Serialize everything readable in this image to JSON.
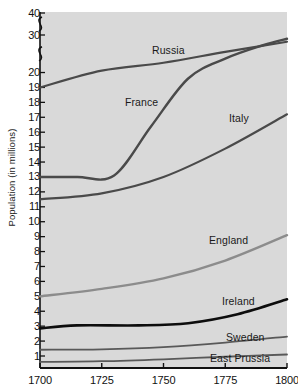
{
  "chart_data": {
    "type": "line",
    "title": "",
    "xlabel": "",
    "ylabel": "Population (in millions)",
    "xlim": [
      1700,
      1800
    ],
    "ylim": [
      0,
      40
    ],
    "grid": false,
    "legend_position": "inline-labels",
    "axis_break": {
      "present": true,
      "between": [
        [
          20,
          30
        ],
        [
          30,
          40
        ]
      ],
      "note": "y-axis compressed above 20 with break squiggles"
    },
    "x_ticks": [
      1700,
      1725,
      1750,
      1775,
      1800
    ],
    "y_ticks": [
      1,
      2,
      3,
      4,
      5,
      6,
      7,
      8,
      9,
      10,
      11,
      12,
      13,
      14,
      15,
      16,
      17,
      18,
      19,
      20,
      30,
      40
    ],
    "background_color": "#d9d9d9",
    "series": [
      {
        "name": "Russia",
        "color": "#4a4a4a",
        "width": 2.2,
        "x": [
          1700,
          1725,
          1750,
          1775,
          1800
        ],
        "values": [
          19.0,
          20.5,
          22.6,
          25.5,
          28.2
        ]
      },
      {
        "name": "France",
        "color": "#4a4a4a",
        "width": 2.4,
        "x": [
          1700,
          1715,
          1730,
          1745,
          1760,
          1775,
          1790,
          1800
        ],
        "values": [
          13.0,
          13.0,
          13.1,
          16.4,
          19.6,
          23.7,
          27.2,
          29.0
        ]
      },
      {
        "name": "Italy",
        "color": "#4a4a4a",
        "width": 2.2,
        "x": [
          1700,
          1725,
          1750,
          1775,
          1800
        ],
        "values": [
          11.5,
          11.9,
          13.0,
          14.9,
          17.2
        ]
      },
      {
        "name": "England",
        "color": "#8c8c8c",
        "width": 2.4,
        "x": [
          1700,
          1725,
          1750,
          1775,
          1800
        ],
        "values": [
          5.0,
          5.5,
          6.2,
          7.4,
          9.1
        ]
      },
      {
        "name": "Ireland",
        "color": "#0d0d0d",
        "width": 2.6,
        "x": [
          1700,
          1715,
          1740,
          1760,
          1780,
          1800
        ],
        "values": [
          2.85,
          3.05,
          3.05,
          3.2,
          3.8,
          4.8
        ]
      },
      {
        "name": "Sweden",
        "color": "#595959",
        "width": 1.8,
        "x": [
          1700,
          1725,
          1750,
          1775,
          1800
        ],
        "values": [
          1.42,
          1.45,
          1.6,
          1.9,
          2.3
        ]
      },
      {
        "name": "East Prussia",
        "color": "#595959",
        "width": 1.8,
        "x": [
          1700,
          1725,
          1750,
          1775,
          1800
        ],
        "values": [
          0.6,
          0.65,
          0.78,
          0.95,
          1.1
        ]
      }
    ],
    "series_label_positions": [
      {
        "name": "Russia",
        "left": 152,
        "top": 44
      },
      {
        "name": "France",
        "left": 125,
        "top": 96
      },
      {
        "name": "Italy",
        "left": 229,
        "top": 112
      },
      {
        "name": "England",
        "left": 209,
        "top": 234
      },
      {
        "name": "Ireland",
        "left": 222,
        "top": 295
      },
      {
        "name": "Sweden",
        "left": 226,
        "top": 331
      },
      {
        "name": "East Prussia",
        "left": 210,
        "top": 352
      }
    ]
  }
}
